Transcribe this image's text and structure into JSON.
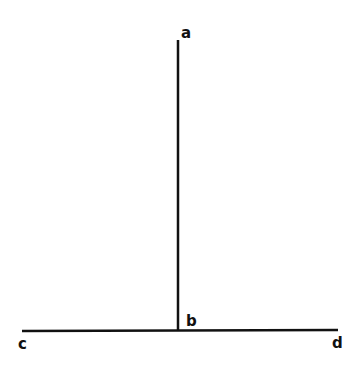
{
  "diagram": {
    "labels": {
      "a": "a",
      "b": "b",
      "c": "c",
      "d": "d"
    },
    "line_color": "#111111",
    "vertical_line": {
      "from": "a",
      "to": "b"
    },
    "horizontal_line": {
      "from": "c",
      "to": "d"
    }
  }
}
